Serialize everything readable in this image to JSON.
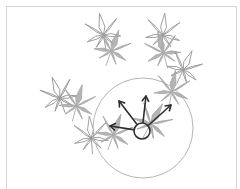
{
  "diagram": {
    "type": "leaf-neighborhood-illustration",
    "colors": {
      "frame": "#d4d4d4",
      "leaf_outline_stroke": "#9a9a9a",
      "leaf_fill": "#a8a8a8",
      "neighborhood_circle": "#b5b5b5",
      "arrows": "#2e2e2e",
      "center_marker": "#2e2e2e"
    },
    "neighborhood": {
      "cx": 143,
      "cy": 128,
      "r": 50
    },
    "center_marker": {
      "cx": 142,
      "cy": 131,
      "r": 8
    },
    "arrows": [
      {
        "name": "arrow-left",
        "x2": 110,
        "y2": 126
      },
      {
        "name": "arrow-up-left",
        "x2": 119,
        "y2": 101
      },
      {
        "name": "arrow-up",
        "x2": 146,
        "y2": 96
      },
      {
        "name": "arrow-up-right",
        "x2": 171,
        "y2": 105
      }
    ],
    "leaf_pairs": [
      {
        "outline": {
          "x": 103,
          "y": 33,
          "rot": -10,
          "s": 1.0
        },
        "filled": {
          "x": 112,
          "y": 49,
          "rot": 20,
          "s": 1.0
        }
      },
      {
        "outline": {
          "x": 163,
          "y": 33,
          "rot": 5,
          "s": 1.0
        },
        "filled": {
          "x": 163,
          "y": 51,
          "rot": -15,
          "s": 1.0
        }
      },
      {
        "outline": {
          "x": 184,
          "y": 68,
          "rot": 25,
          "s": 0.95
        },
        "filled": {
          "x": 172,
          "y": 90,
          "rot": 10,
          "s": 1.0
        }
      },
      {
        "outline": {
          "x": 59,
          "y": 96,
          "rot": -20,
          "s": 1.0
        },
        "filled": {
          "x": 77,
          "y": 104,
          "rot": 15,
          "s": 1.0
        }
      },
      {
        "outline": {
          "x": 91,
          "y": 136,
          "rot": -5,
          "s": 1.0
        },
        "filled": {
          "x": 114,
          "y": 133,
          "rot": 20,
          "s": 1.0
        }
      }
    ],
    "center_leaf": {
      "x": 152,
      "y": 122,
      "rot": 30,
      "s": 1.05
    }
  }
}
